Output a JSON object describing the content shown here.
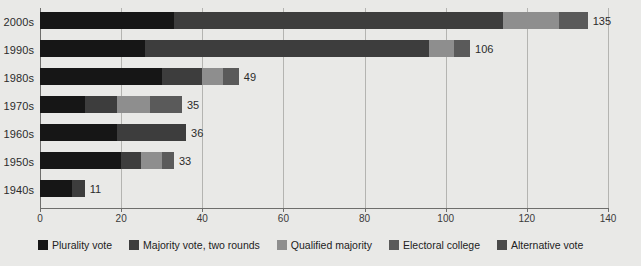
{
  "chart_data": {
    "type": "bar",
    "orientation": "horizontal",
    "stacked": true,
    "title": "",
    "subtitle": "",
    "xlabel": "",
    "ylabel": "",
    "xlim": [
      0,
      140
    ],
    "xticks": [
      0,
      20,
      40,
      60,
      80,
      100,
      120,
      140
    ],
    "xtick_labels": [
      "0",
      "20",
      "40",
      "60",
      "80",
      "100",
      "120",
      "140"
    ],
    "grid": true,
    "grid_axis": "x",
    "legend_position": "bottom",
    "categories": [
      "2000s",
      "1990s",
      "1980s",
      "1970s",
      "1960s",
      "1950s",
      "1940s"
    ],
    "series": [
      {
        "name": "Plurality vote",
        "color": "#161616",
        "values": [
          33,
          26,
          30,
          11,
          19,
          20,
          8
        ]
      },
      {
        "name": "Majority vote, two rounds",
        "color": "#3d3d3d",
        "values": [
          81,
          70,
          10,
          8,
          17,
          5,
          3
        ]
      },
      {
        "name": "Qualified majority",
        "color": "#8e8e8e",
        "values": [
          14,
          6,
          5,
          8,
          0,
          5,
          0
        ]
      },
      {
        "name": "Electoral college",
        "color": "#5a5a5a",
        "values": [
          7,
          4,
          4,
          8,
          0,
          3,
          0
        ]
      },
      {
        "name": "Alternative vote",
        "color": "#4a4a4a",
        "values": [
          0,
          0,
          0,
          0,
          0,
          0,
          0
        ]
      }
    ],
    "totals": [
      135,
      106,
      49,
      35,
      36,
      33,
      11
    ],
    "total_labels": [
      "135",
      "106",
      "49",
      "35",
      "36",
      "33",
      "11"
    ]
  },
  "legend": {
    "items": [
      {
        "label": "Plurality vote"
      },
      {
        "label": "Majority vote, two rounds"
      },
      {
        "label": "Qualified majority"
      },
      {
        "label": "Electoral college"
      },
      {
        "label": "Alternative vote"
      }
    ]
  },
  "colors": {
    "background": "#e9e9e7",
    "gridline": "#b4b4b1",
    "axis": "#6e6e6c",
    "text": "#2b2b2b"
  }
}
